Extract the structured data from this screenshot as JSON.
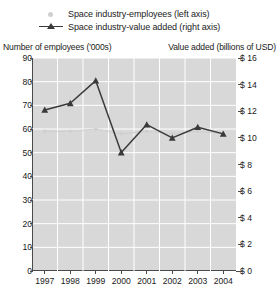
{
  "legend": {
    "position": "top-left",
    "items": [
      {
        "label": "Space industry-employees (left axis)",
        "marker": "dot",
        "color": "#cfcfcf"
      },
      {
        "label": "Space industry-value added (right axis)",
        "marker": "line-triangle",
        "color": "#3a3a3a"
      }
    ]
  },
  "axes": {
    "left_title": "Number of employees ('000s)",
    "right_title": "Value added (billions of USD)"
  },
  "chart_data": {
    "type": "line",
    "title": "",
    "subtitle": "",
    "xlabel": "",
    "ylabel": "Number of employees ('000s)",
    "y2label": "Value added (billions of USD)",
    "grid": true,
    "legend_position": "top-left",
    "categories": [
      "1997",
      "1998",
      "1999",
      "2000",
      "2001",
      "2002",
      "2003",
      "2004"
    ],
    "x": [
      1997,
      1998,
      1999,
      2000,
      2001,
      2002,
      2003,
      2004
    ],
    "ylim": [
      0,
      90
    ],
    "yticks": [
      0,
      10,
      20,
      30,
      40,
      50,
      60,
      70,
      80,
      90
    ],
    "ytick_labels": [
      "0",
      "10",
      "20",
      "30",
      "40",
      "50",
      "60",
      "70",
      "80",
      "90"
    ],
    "y2lim": [
      0,
      16
    ],
    "y2ticks": [
      0,
      2,
      4,
      6,
      8,
      10,
      12,
      14,
      16
    ],
    "y2tick_labels": [
      "$ 0",
      "$ 2",
      "$ 4",
      "$ 6",
      "$ 8",
      "$ 10",
      "$ 12",
      "$ 14",
      "$ 16"
    ],
    "series": [
      {
        "name": "Space industry-employees (left axis)",
        "axis": "left",
        "color": "#cfcfcf",
        "marker": "dot",
        "values": [
          59,
          59,
          60,
          58,
          59,
          58,
          59,
          58
        ]
      },
      {
        "name": "Space industry-value added (right axis)",
        "axis": "right",
        "color": "#3a3a3a",
        "marker": "triangle",
        "values": [
          12.1,
          12.6,
          14.3,
          8.9,
          11.0,
          10.0,
          10.8,
          10.3
        ]
      }
    ]
  }
}
